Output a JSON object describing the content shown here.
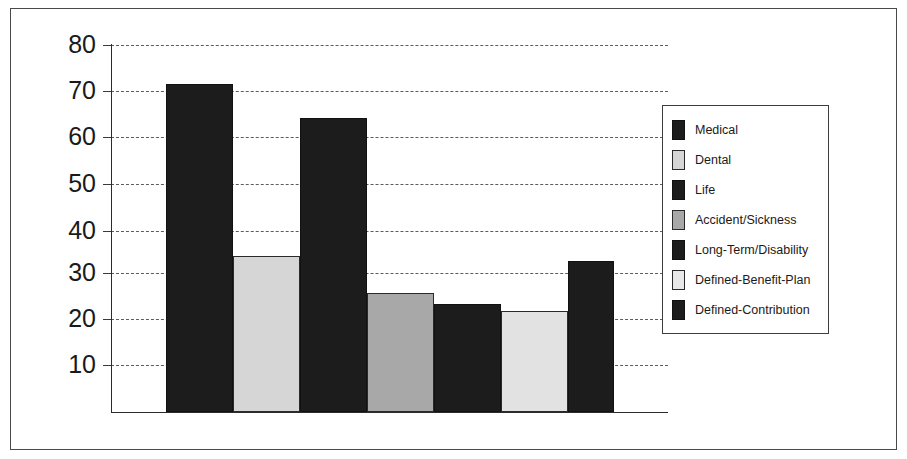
{
  "chart_data": {
    "type": "bar",
    "title": "",
    "subtitle": "",
    "xlabel": "",
    "ylabel": "",
    "ylim": [
      0,
      80
    ],
    "grid": true,
    "legend_position": "right",
    "ytick_labels": [
      "80",
      "70",
      "60",
      "50",
      "40",
      "30",
      "20",
      "10"
    ],
    "ytick_values": [
      80,
      70,
      60,
      50,
      40,
      30,
      20,
      10
    ],
    "categories": [
      "Medical",
      "Dental",
      "Life",
      "Accident/Sickness",
      "Long-Term/Disability",
      "Defined-Benefit-Plan",
      "Defined-Contribution"
    ],
    "values": [
      71.5,
      34,
      64,
      26,
      23.5,
      22,
      33
    ],
    "colors": [
      "#1c1c1c",
      "#d6d6d6",
      "#1c1c1c",
      "#a8a8a8",
      "#1c1c1c",
      "#e2e2e2",
      "#1c1c1c"
    ],
    "bar_styles": [
      "dark",
      "light",
      "dark",
      "mid",
      "dark",
      "pale",
      "dark"
    ],
    "series": [
      {
        "name": "",
        "values": [
          71.5,
          34,
          64,
          26,
          23.5,
          22,
          33
        ]
      }
    ]
  },
  "legend": {
    "items": [
      {
        "label": "Medical",
        "style": "dark"
      },
      {
        "label": "Dental",
        "style": "light"
      },
      {
        "label": "Life",
        "style": "dark"
      },
      {
        "label": "Accident/Sickness",
        "style": "mid"
      },
      {
        "label": "Long-Term/Disability",
        "style": "dark"
      },
      {
        "label": "Defined-Benefit-Plan",
        "style": "pale"
      },
      {
        "label": "Defined-Contribution",
        "style": "dark"
      }
    ]
  },
  "axis": {
    "y_labels": [
      "80",
      "70",
      "60",
      "50",
      "40",
      "30",
      "20",
      "10"
    ]
  }
}
